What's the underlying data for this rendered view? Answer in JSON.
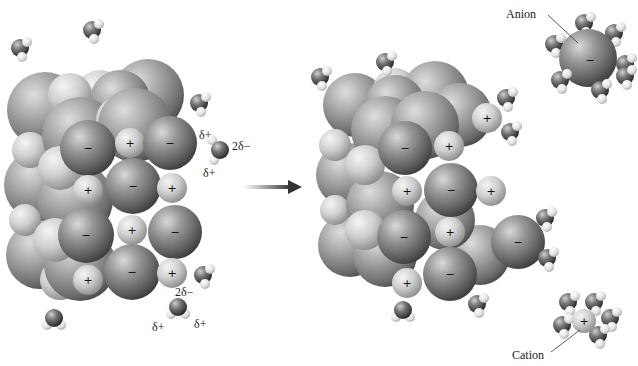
{
  "diagram": {
    "type": "ionic-solid-dissolution",
    "colors": {
      "anion_dark": "#3c3c3c",
      "anion_mid": "#8a8a8a",
      "anion_light": "#d8d8d8",
      "cation_dark": "#8e8e8e",
      "cation_light": "#f2f2f2",
      "hydrogen_light": "#f4f4f4",
      "hydrogen_dark": "#bdbdbd",
      "oxygen_dark": "#2a2a2a",
      "arrow": "#333333",
      "text": "#222222"
    },
    "labels": {
      "anion": "Anion",
      "cation": "Cation"
    },
    "signs": {
      "minus": "−",
      "plus": "+"
    },
    "partial_charges": {
      "water_top": {
        "h1": "δ+",
        "o": "2δ−",
        "h2": "δ+"
      },
      "water_bottom": {
        "o": "2δ−",
        "h1": "δ+",
        "h2": "δ+"
      }
    },
    "arrow": {
      "direction": "right",
      "meaning": "dissolution proceeds"
    },
    "panels": [
      {
        "name": "before",
        "description": "Intact ionic crystal surrounded by water molecules"
      },
      {
        "name": "after",
        "description": "Ions leaving the crystal, hydrated by water"
      }
    ]
  }
}
